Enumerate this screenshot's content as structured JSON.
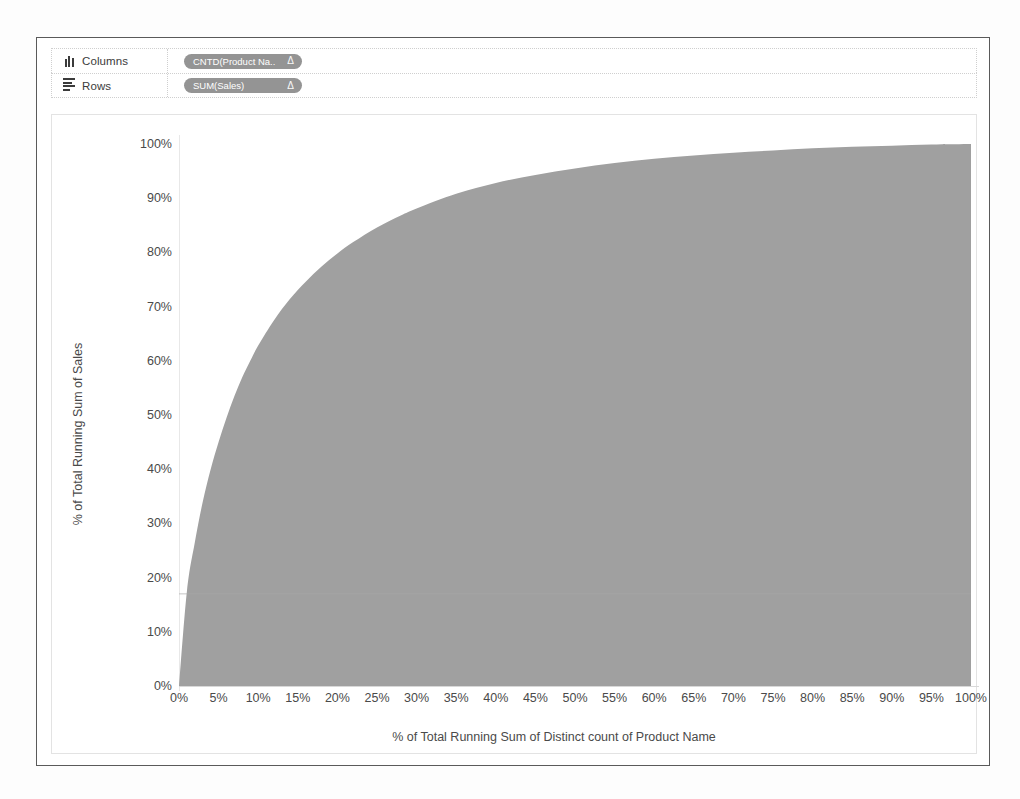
{
  "window": {
    "title": "Tableau worksheet"
  },
  "shelves": [
    {
      "icon": "columns-icon",
      "label": "Columns",
      "pill": {
        "text": "CNTD(Product Na..",
        "glyph": "Δ"
      }
    },
    {
      "icon": "rows-icon",
      "label": "Rows",
      "pill": {
        "text": "SUM(Sales)",
        "glyph": "Δ"
      }
    }
  ],
  "colors": {
    "area_fill": "#a0a0a0",
    "pill_bg": "#949494",
    "axis": "#d8d8d8",
    "text": "#4a4a4a",
    "frame": "#5a5a5a"
  },
  "chart_data": {
    "type": "area",
    "title": "",
    "xlabel": "% of Total Running Sum of Distinct count of Product Name",
    "ylabel": "% of Total Running Sum of Sales",
    "xlim": [
      0,
      100
    ],
    "ylim": [
      0,
      100
    ],
    "grid": false,
    "legend": null,
    "series": [
      {
        "name": "% of Total Running Sum of Sales",
        "fill": "#a0a0a0",
        "x": [
          0,
          1,
          2,
          3,
          4,
          5,
          6,
          7,
          8,
          9,
          10,
          12,
          14,
          16,
          18,
          20,
          22,
          25,
          28,
          30,
          35,
          40,
          45,
          50,
          55,
          60,
          65,
          70,
          75,
          80,
          85,
          90,
          95,
          100
        ],
        "y": [
          0,
          17.5,
          26.5,
          34.0,
          40.0,
          45.0,
          49.5,
          53.5,
          57.0,
          60.0,
          62.8,
          67.5,
          71.4,
          74.6,
          77.4,
          79.8,
          81.9,
          84.6,
          86.8,
          88.1,
          90.8,
          92.8,
          94.3,
          95.5,
          96.5,
          97.3,
          97.9,
          98.4,
          98.8,
          99.2,
          99.5,
          99.7,
          99.9,
          100
        ]
      }
    ],
    "xticks": [
      "0%",
      "5%",
      "10%",
      "15%",
      "20%",
      "25%",
      "30%",
      "35%",
      "40%",
      "45%",
      "50%",
      "55%",
      "60%",
      "65%",
      "70%",
      "75%",
      "80%",
      "85%",
      "90%",
      "95%",
      "100%"
    ],
    "xtick_values": [
      0,
      5,
      10,
      15,
      20,
      25,
      30,
      35,
      40,
      45,
      50,
      55,
      60,
      65,
      70,
      75,
      80,
      85,
      90,
      95,
      100
    ],
    "yticks": [
      "0%",
      "10%",
      "20%",
      "30%",
      "40%",
      "50%",
      "60%",
      "70%",
      "80%",
      "90%",
      "100%"
    ],
    "ytick_values": [
      0,
      10,
      20,
      30,
      40,
      50,
      60,
      70,
      80,
      90,
      100
    ]
  }
}
